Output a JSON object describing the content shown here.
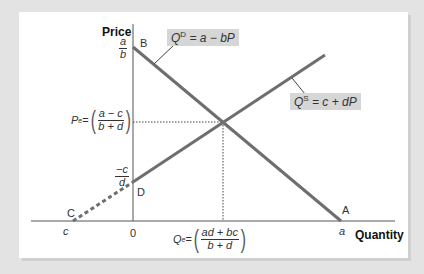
{
  "diagram": {
    "type": "supply-demand",
    "axes": {
      "y_label": "Price",
      "x_label": "Quantity",
      "origin_label": "0"
    },
    "curves": {
      "demand": {
        "equation_var": "Q",
        "equation_sup": "D",
        "equation_rhs": " = a − bP",
        "from": [
          133,
          47
        ],
        "to": [
          341,
          221
        ]
      },
      "supply": {
        "equation_var": "Q",
        "equation_sup": "S",
        "equation_rhs": " = c + dP",
        "solid_from": [
          133,
          182
        ],
        "solid_to": [
          325,
          55
        ],
        "dashed_from": [
          73,
          221
        ],
        "dashed_to": [
          133,
          182
        ]
      }
    },
    "points": {
      "A": "A",
      "B": "B",
      "C": "C",
      "D": "D"
    },
    "axis_values": {
      "a_over_b": {
        "num": "a",
        "den": "b"
      },
      "neg_c_over_d": {
        "num": "−c",
        "den": "d"
      },
      "c": "c",
      "a": "a"
    },
    "equilibrium": {
      "price_label": "P",
      "price_sup": "e",
      "price_eq": " =",
      "price_num": "a − c",
      "price_den": "b + d",
      "quantity_label": "Q",
      "quantity_sup": "e",
      "quantity_eq": " =",
      "quantity_num": "ad + bc",
      "quantity_den": "b + d",
      "point": [
        223,
        122
      ]
    }
  },
  "colors": {
    "background": "#e3e3e3",
    "card": "#ffffff",
    "curve": "#6e6e6e",
    "axis": "#555555",
    "label_box": "#d6d6d6"
  }
}
